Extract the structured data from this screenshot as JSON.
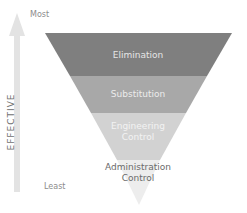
{
  "axis": {
    "top_label": "Most",
    "bottom_label": "Least",
    "arrow_label": "EFFECTIVE"
  },
  "levels": [
    {
      "label": "Elimination",
      "color": "#7f7f7f",
      "text_color": "#e6e6e6"
    },
    {
      "label": "Substitution",
      "color": "#a8a8a8",
      "text_color": "#ececec"
    },
    {
      "label": "Engineering",
      "label2": "Control",
      "color": "#d0d0d0",
      "text_color": "#f3f3f3"
    },
    {
      "label": "Administration",
      "label2": "Control",
      "color": "#ececec",
      "text_color": "#6a6a6a"
    }
  ],
  "colors": {
    "arrow": "#e3e3e3"
  }
}
